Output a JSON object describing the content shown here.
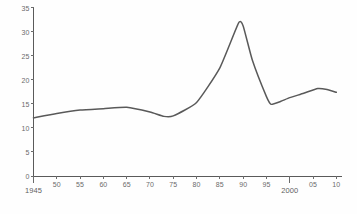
{
  "chart_data": {
    "type": "line",
    "title": "",
    "subtitle": "",
    "xlabel": "",
    "ylabel": "",
    "xlim": [
      1945,
      2011
    ],
    "ylim": [
      0,
      35
    ],
    "grid": false,
    "legend": null,
    "y_ticks": [
      0,
      5,
      10,
      15,
      20,
      25,
      30,
      35
    ],
    "y_tick_labels": [
      "0",
      "5",
      "10",
      "15",
      "20",
      "25",
      "30",
      "35"
    ],
    "x_ticks": [
      1945,
      1950,
      1955,
      1960,
      1965,
      1970,
      1975,
      1980,
      1985,
      1990,
      1995,
      2000,
      2005,
      2010
    ],
    "x_tick_labels": [
      "1945",
      "50",
      "55",
      "60",
      "65",
      "70",
      "75",
      "80",
      "85",
      "90",
      "95",
      "2000",
      "05",
      "10"
    ],
    "x_major_ticks": [
      1945,
      2000
    ],
    "series": [
      {
        "name": "series-1",
        "color": "#595959",
        "x": [
          1945,
          1950,
          1955,
          1960,
          1965,
          1970,
          1973,
          1975,
          1980,
          1985,
          1989,
          1990,
          1992,
          1995,
          1996,
          1998,
          2000,
          2003,
          2006,
          2008,
          2010
        ],
        "values": [
          12.1,
          13.0,
          13.7,
          14.0,
          14.3,
          13.3,
          12.4,
          12.5,
          15.3,
          22.5,
          31.8,
          31.2,
          24.0,
          16.5,
          14.9,
          15.5,
          16.3,
          17.2,
          18.2,
          18.0,
          17.4
        ]
      }
    ]
  },
  "axes": {
    "line_color": "#5a5a5a",
    "tick_color": "#6b6b6b",
    "label_color": "#6b6b6b"
  }
}
